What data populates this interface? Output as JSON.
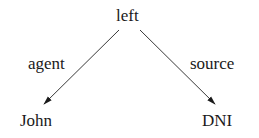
{
  "diagram": {
    "type": "dependency-tree",
    "root": {
      "label": "left"
    },
    "edges": [
      {
        "label": "agent",
        "from": "left",
        "to": "John"
      },
      {
        "label": "source",
        "from": "left",
        "to": "DNI"
      }
    ],
    "children": [
      {
        "label": "John"
      },
      {
        "label": "DNI"
      }
    ],
    "colors": {
      "line": "#3a3a3a",
      "text": "#1a1a1a",
      "background": "#ffffff"
    }
  }
}
